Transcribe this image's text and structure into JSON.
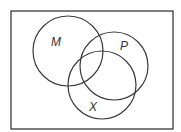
{
  "diagram": {
    "type": "venn",
    "universal_set": {
      "label": "",
      "x": 11,
      "y": 11,
      "width": 162,
      "height": 118
    },
    "sets": [
      {
        "label": "M",
        "cx": 68,
        "cy": 51,
        "r": 35,
        "label_x": 56,
        "label_y": 46
      },
      {
        "label": "P",
        "cx": 114,
        "cy": 66,
        "r": 34,
        "label_x": 124,
        "label_y": 50
      },
      {
        "label": "X",
        "cx": 102,
        "cy": 85,
        "r": 34,
        "label_x": 93,
        "label_y": 111
      }
    ],
    "stroke_color": "#3a3a3a",
    "background": "#ffffff"
  }
}
